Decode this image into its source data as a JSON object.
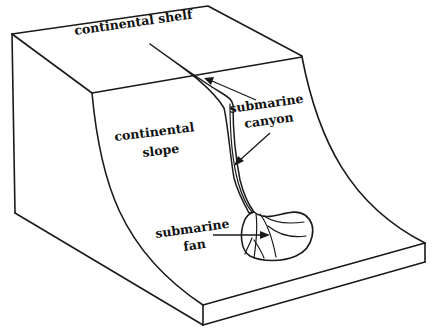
{
  "diagram": {
    "labels": {
      "continental_shelf": "continental shelf",
      "continental_slope_line1": "continental",
      "continental_slope_line2": "slope",
      "submarine_canyon_line1": "submarine",
      "submarine_canyon_line2": "canyon",
      "submarine_fan_line1": "submarine",
      "submarine_fan_line2": "fan"
    },
    "colors": {
      "ink": "#1a1a1a",
      "background": "#ffffff"
    }
  }
}
